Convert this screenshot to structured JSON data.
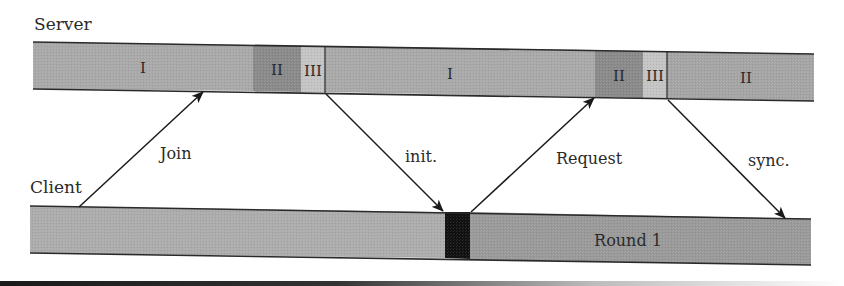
{
  "diagram": {
    "type": "sequence-timeline",
    "lanes": {
      "server": {
        "label": "Server"
      },
      "client": {
        "label": "Client"
      }
    },
    "server_segments": [
      {
        "label": "I",
        "phase": "I",
        "x0": 33,
        "x1": 253,
        "color": "#a9a9a9"
      },
      {
        "label": "II",
        "phase": "II",
        "x0": 253,
        "x1": 301,
        "color": "#8a8a8a"
      },
      {
        "label": "III",
        "phase": "III",
        "x0": 301,
        "x1": 325,
        "color": "#c4c4c4"
      },
      {
        "label": "I",
        "phase": "I",
        "x0": 325,
        "x1": 595,
        "color": "#a9a9a9"
      },
      {
        "label": "II",
        "phase": "II",
        "x0": 595,
        "x1": 643,
        "color": "#8a8a8a"
      },
      {
        "label": "III",
        "phase": "III",
        "x0": 643,
        "x1": 667,
        "color": "#c4c4c4"
      },
      {
        "label": "II",
        "phase": "II",
        "x0": 667,
        "x1": 814,
        "color": "#a5a5a5"
      }
    ],
    "client_segments": [
      {
        "label": "",
        "x0": 30,
        "x1": 445,
        "color": "#acacac"
      },
      {
        "label": "",
        "x0": 445,
        "x1": 470,
        "color": "#111111"
      },
      {
        "label": "Round 1",
        "x0": 470,
        "x1": 811,
        "color": "#9a9a9a"
      }
    ],
    "messages": [
      {
        "label": "Join",
        "from": "client",
        "to": "server",
        "direction": "up"
      },
      {
        "label": "init.",
        "from": "server",
        "to": "client",
        "direction": "down"
      },
      {
        "label": "Request",
        "from": "client",
        "to": "server",
        "direction": "up"
      },
      {
        "label": "sync.",
        "from": "server",
        "to": "client",
        "direction": "down"
      }
    ]
  }
}
